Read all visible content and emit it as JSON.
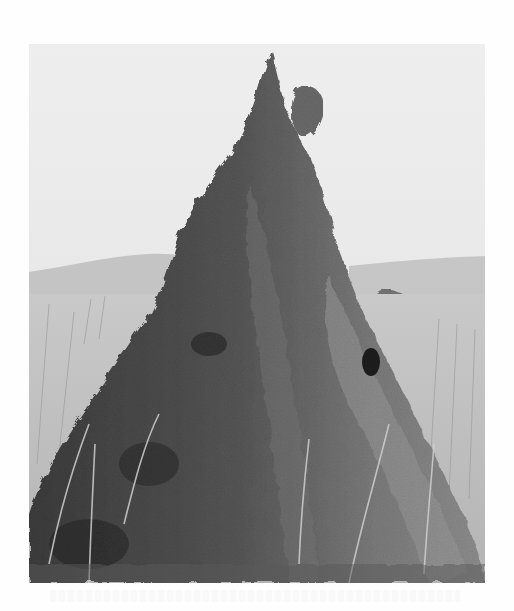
{
  "figure": {
    "style": "grayscale halftone photograph",
    "scene": {
      "sky": "overcast light gray",
      "background": "distant hills with a tree on the right",
      "foreground": "tall dry grass field",
      "mound": "tall conical earthen termite mound with a pointed spire and a rounded knob near the top"
    },
    "colors": {
      "page": "#fefefe",
      "sky": "#ececec",
      "hills": "#bdbdbd",
      "grass": "#d0d0d0",
      "mound_dark": "#3a3a3a",
      "mound_mid": "#6a6a6a",
      "mound_light": "#9a9a9a"
    }
  }
}
